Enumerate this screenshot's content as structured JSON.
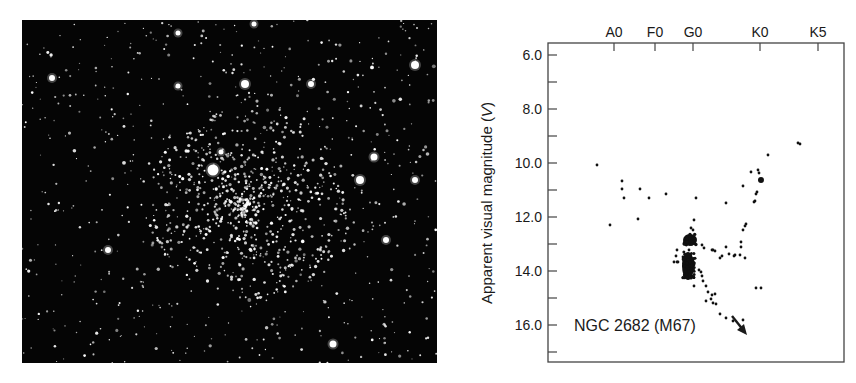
{
  "figure": {
    "photo": {
      "subject": "star-cluster-photograph",
      "background_color": "#050505",
      "star_color": "#ffffff"
    }
  },
  "chart_data": {
    "type": "scatter",
    "title": "",
    "annotation": {
      "text": "NGC 2682 (M67)",
      "arrow": "arrow pointing down-right"
    },
    "xlabel": "",
    "x_axis_position": "top",
    "x_ticks": [
      {
        "label": "A0",
        "pos": 0.0
      },
      {
        "label": "F0",
        "pos": 1.0
      },
      {
        "label": "G0",
        "pos": 2.0
      },
      {
        "label": "K0",
        "pos": 3.6
      },
      {
        "label": "K5",
        "pos": 5.1
      }
    ],
    "ylabel": "Apparent visual magnitude (V)",
    "ylabel_main": "Apparent visual magnitude (",
    "ylabel_var": "V",
    "ylabel_end": ")",
    "ylim": [
      17.2,
      5.6
    ],
    "y_inverted": true,
    "y_ticks": [
      {
        "label": "6.0",
        "value": 6.0
      },
      {
        "label": "8.0",
        "value": 8.0
      },
      {
        "label": "10.0",
        "value": 10.0
      },
      {
        "label": "12.0",
        "value": 12.0
      },
      {
        "label": "14.0",
        "value": 14.0
      },
      {
        "label": "16.0",
        "value": 16.0
      }
    ],
    "y_minor_ticks": [
      7.0,
      9.0,
      11.0,
      13.0,
      15.0,
      17.0
    ],
    "grid": false,
    "legend": null,
    "series": [
      {
        "name": "NGC 2682 (M67) stars",
        "points_px": [
          [
            597,
            165
          ],
          [
            622,
            181
          ],
          [
            622,
            189
          ],
          [
            624,
            198
          ],
          [
            640,
            189
          ],
          [
            649,
            198
          ],
          [
            666,
            194
          ],
          [
            696,
            198
          ],
          [
            726,
            203
          ],
          [
            743,
            186
          ],
          [
            751,
            172
          ],
          [
            768,
            155
          ],
          [
            798,
            143
          ],
          [
            800,
            144
          ],
          [
            758,
            170
          ],
          [
            759,
            173
          ],
          [
            757,
            192
          ],
          [
            756,
            194
          ],
          [
            755,
            201
          ],
          [
            754,
            202
          ],
          [
            746,
            224
          ],
          [
            745,
            226
          ],
          [
            743,
            230
          ],
          [
            741,
            242
          ],
          [
            726,
            247
          ],
          [
            610,
            225
          ],
          [
            638,
            219
          ],
          [
            694,
            220
          ],
          [
            693,
            230
          ],
          [
            691,
            228
          ],
          [
            684,
            244
          ],
          [
            689,
            250
          ],
          [
            702,
            245
          ],
          [
            704,
            248
          ],
          [
            712,
            250
          ],
          [
            713,
            250
          ],
          [
            715,
            251
          ],
          [
            722,
            256
          ],
          [
            720,
            258
          ],
          [
            729,
            254
          ],
          [
            734,
            256
          ],
          [
            735,
            255
          ],
          [
            740,
            255
          ],
          [
            745,
            258
          ],
          [
            677,
            250
          ],
          [
            676,
            256
          ],
          [
            683,
            257
          ],
          [
            674,
            262
          ],
          [
            677,
            262
          ],
          [
            678,
            262
          ],
          [
            699,
            270
          ],
          [
            701,
            272
          ],
          [
            702,
            276
          ],
          [
            703,
            281
          ],
          [
            694,
            286
          ],
          [
            706,
            286
          ],
          [
            708,
            292
          ],
          [
            712,
            295
          ],
          [
            715,
            294
          ],
          [
            711,
            299
          ],
          [
            706,
            301
          ],
          [
            713,
            303
          ],
          [
            716,
            304
          ],
          [
            720,
            314
          ],
          [
            726,
            318
          ],
          [
            733,
            321
          ],
          [
            743,
            320
          ],
          [
            756,
            288
          ],
          [
            761,
            288
          ],
          [
            741,
            247
          ]
        ],
        "dense_blobs_px": [
          {
            "cx": 690,
            "cy": 240,
            "rx": 7,
            "ry": 6,
            "note": "red-clump / turnoff blob at G0, V≈12.7"
          },
          {
            "cx": 688,
            "cy": 266,
            "rx": 6,
            "ry": 14,
            "note": "main-sequence band V≈13.2-14.0"
          },
          {
            "cx": 761,
            "cy": 180,
            "rx": 3,
            "ry": 3,
            "note": "giant clump near K0, V≈10.6"
          }
        ]
      }
    ]
  }
}
